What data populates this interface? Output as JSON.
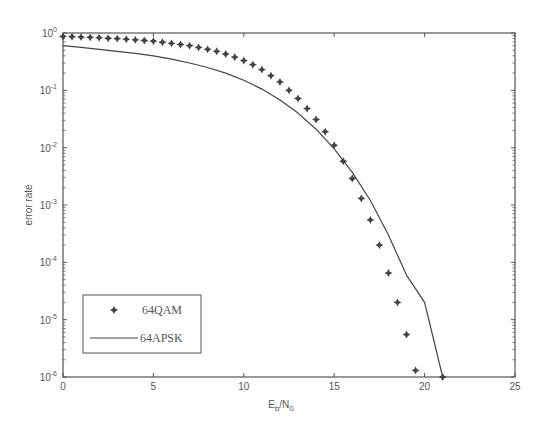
{
  "chart_data": {
    "type": "line",
    "title": "",
    "xlabel": "E_b/N_0",
    "xlabel_main": "E",
    "xlabel_sub1": "b",
    "xlabel_sep": "/N",
    "xlabel_sub2": "0",
    "ylabel": "error rate",
    "xlim": [
      0,
      25
    ],
    "ylim": [
      1e-06,
      1
    ],
    "yscale": "log",
    "grid": false,
    "legend_position": "lower left",
    "x_ticks": [
      0,
      5,
      10,
      15,
      20,
      25
    ],
    "y_ticks": [
      {
        "exp": "0",
        "value": 1
      },
      {
        "exp": "-1",
        "value": 0.1
      },
      {
        "exp": "-2",
        "value": 0.01
      },
      {
        "exp": "-3",
        "value": 0.001
      },
      {
        "exp": "-4",
        "value": 0.0001
      },
      {
        "exp": "-5",
        "value": 1e-05
      },
      {
        "exp": "-6",
        "value": 1e-06
      }
    ],
    "series": [
      {
        "name": "64QAM",
        "style": "marker",
        "marker": "plus-diamond",
        "x": [
          0,
          0.5,
          1,
          1.5,
          2,
          2.5,
          3,
          3.5,
          4,
          4.5,
          5,
          5.5,
          6,
          6.5,
          7,
          7.5,
          8,
          8.5,
          9,
          9.5,
          10,
          10.5,
          11,
          11.5,
          12,
          12.5,
          13,
          13.5,
          14,
          14.5,
          15,
          15.5,
          16,
          16.5,
          17,
          17.5,
          18,
          18.5,
          19,
          19.5,
          20,
          20.5,
          21
        ],
        "values": [
          0.87,
          0.86,
          0.85,
          0.84,
          0.83,
          0.81,
          0.8,
          0.78,
          0.76,
          0.74,
          0.72,
          0.69,
          0.66,
          0.63,
          0.6,
          0.56,
          0.52,
          0.48,
          0.43,
          0.38,
          0.33,
          0.28,
          0.23,
          0.18,
          0.14,
          0.1,
          0.072,
          0.048,
          0.031,
          0.019,
          0.011,
          0.0058,
          0.0029,
          0.0013,
          0.00055,
          0.0002,
          6.5e-05,
          2e-05,
          5.5e-06,
          1.3e-06,
          2.7e-07,
          5e-08,
          1e-06
        ]
      },
      {
        "name": "64APSK",
        "style": "line",
        "x": [
          0,
          1,
          2,
          3,
          4,
          5,
          6,
          7,
          8,
          9,
          10,
          11,
          12,
          13,
          14,
          15,
          16,
          17,
          18,
          19,
          20,
          21
        ],
        "values": [
          0.6,
          0.56,
          0.52,
          0.48,
          0.44,
          0.4,
          0.35,
          0.3,
          0.25,
          0.2,
          0.15,
          0.105,
          0.068,
          0.04,
          0.021,
          0.0095,
          0.0037,
          0.0012,
          0.0003,
          6e-05,
          2e-05,
          1e-06
        ]
      }
    ]
  },
  "legend": {
    "items": [
      {
        "label": "64QAM",
        "symbol": "marker"
      },
      {
        "label": "64APSK",
        "symbol": "line"
      }
    ]
  },
  "colors": {
    "axis": "#555555",
    "series": "#444444",
    "background": "#ffffff"
  }
}
